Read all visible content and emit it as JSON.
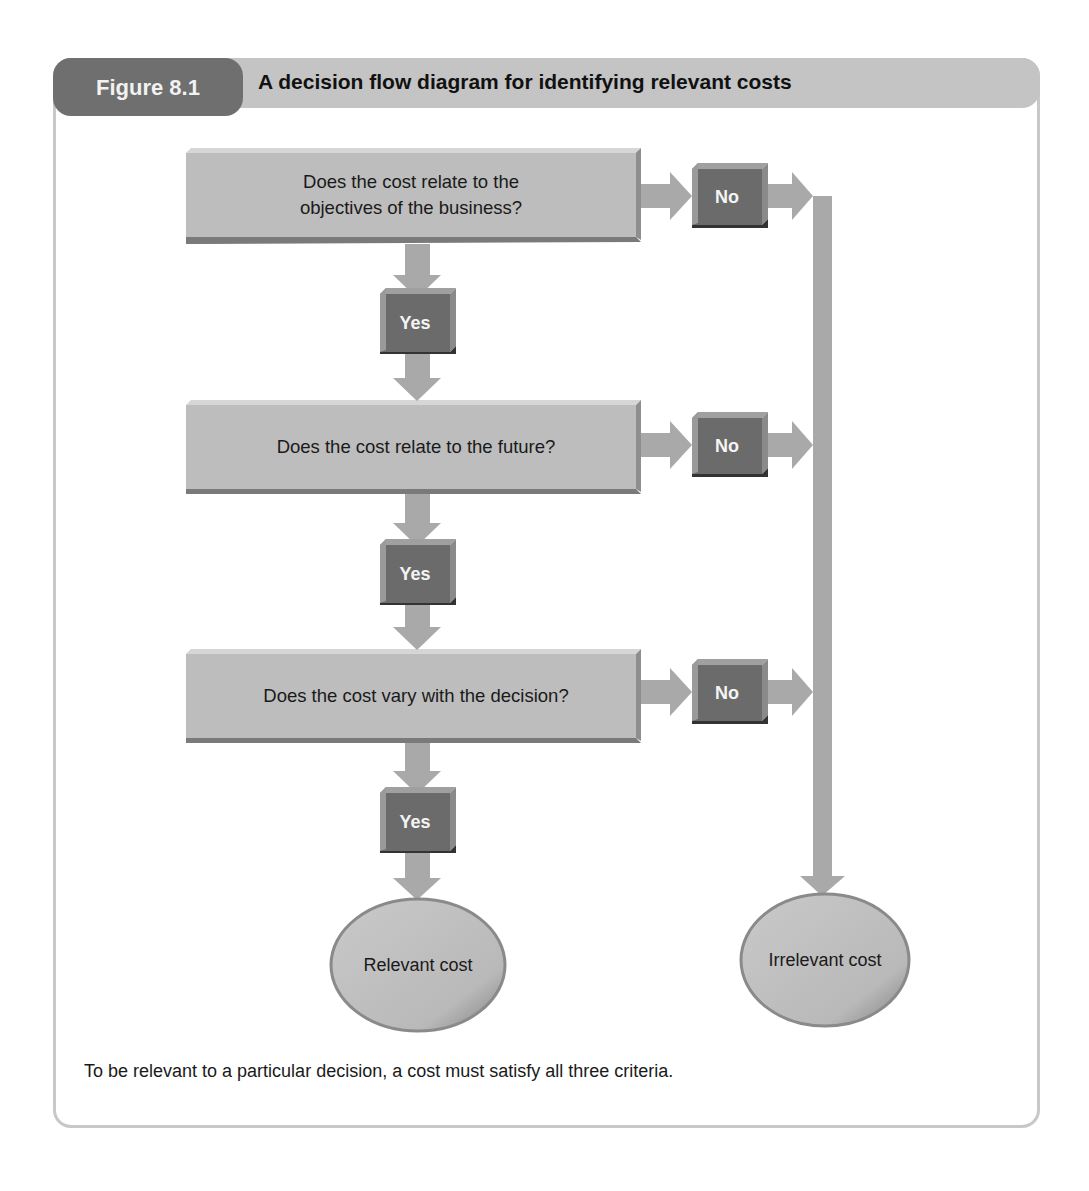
{
  "figure": {
    "label": "Figure 8.1",
    "title": "A decision flow diagram for identifying relevant costs",
    "caption": "To be relevant to a particular decision, a cost must satisfy all three criteria."
  },
  "questions": [
    {
      "text_line1": "Does the cost relate to the",
      "text_line2": "objectives of the business?",
      "yes": "Yes",
      "no": "No"
    },
    {
      "text_line1": "Does the cost relate to the future?",
      "text_line2": "",
      "yes": "Yes",
      "no": "No"
    },
    {
      "text_line1": "Does the cost vary with the decision?",
      "text_line2": "",
      "yes": "Yes",
      "no": "No"
    }
  ],
  "outcomes": {
    "relevant": "Relevant cost",
    "irrelevant": "Irrelevant cost"
  },
  "colors": {
    "box_fill": "#bdbdbd",
    "button_fill": "#6b6b6b",
    "arrow": "#a9a9a9",
    "header": "#c4c4c4",
    "label_tab": "#6f6f6f"
  }
}
